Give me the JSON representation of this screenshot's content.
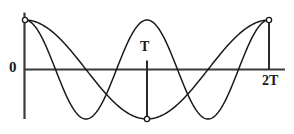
{
  "figure": {
    "title": "",
    "background_color": "#ffffff",
    "curve_color": "#1a1a1a",
    "axis_color": "#3a3a3a",
    "marker_fill": "#ffffff"
  },
  "labels": {
    "origin": "0",
    "period": "T",
    "double_period": "2T"
  },
  "chart_data": {
    "type": "line",
    "title": "",
    "xlabel": "",
    "ylabel": "",
    "xlim": [
      0,
      2
    ],
    "ylim": [
      -1,
      1
    ],
    "grid": false,
    "legend": "none",
    "x_tick_labels": [
      "0",
      "T",
      "2T"
    ],
    "x_tick_values": [
      0,
      1,
      2
    ],
    "x_unit": "T (period)",
    "y_tick_labels": [],
    "annotations": [
      {
        "text": "0",
        "x": 0,
        "y": 0,
        "placement": "left-of-axis"
      },
      {
        "text": "T",
        "x": 1,
        "y": 0,
        "placement": "above-axis"
      },
      {
        "text": "2T",
        "x": 2,
        "y": 0,
        "placement": "below-axis"
      }
    ],
    "markers": [
      {
        "x": 0,
        "y": 1,
        "style": "open-circle"
      },
      {
        "x": 1,
        "y": -1,
        "style": "open-circle"
      },
      {
        "x": 2,
        "y": 1,
        "style": "open-circle"
      }
    ],
    "vertical_guides": [
      {
        "x": 0,
        "y_from": -1,
        "y_to": 1.15,
        "name": "y-axis"
      },
      {
        "x": 1,
        "y_from": -1,
        "y_to": 0.18,
        "name": "t-marker-line"
      },
      {
        "x": 2,
        "y_from": 0,
        "y_to": 1,
        "name": "two-t-marker-line"
      }
    ],
    "series": [
      {
        "name": "fast-mode",
        "description": "cos(2*pi*x) - two full cycles over 0 to 2T",
        "period": 1,
        "amplitude": 1,
        "x": [
          0,
          0.0625,
          0.125,
          0.1875,
          0.25,
          0.3125,
          0.375,
          0.4375,
          0.5,
          0.5625,
          0.625,
          0.6875,
          0.75,
          0.8125,
          0.875,
          0.9375,
          1,
          1.0625,
          1.125,
          1.1875,
          1.25,
          1.3125,
          1.375,
          1.4375,
          1.5,
          1.5625,
          1.625,
          1.6875,
          1.75,
          1.8125,
          1.875,
          1.9375,
          2
        ],
        "y": [
          1,
          0.924,
          0.707,
          0.383,
          0,
          -0.383,
          -0.707,
          -0.924,
          -1,
          -0.924,
          -0.707,
          -0.383,
          0,
          0.383,
          0.707,
          0.924,
          1,
          0.924,
          0.707,
          0.383,
          0,
          -0.383,
          -0.707,
          -0.924,
          -1,
          -0.924,
          -0.707,
          -0.383,
          0,
          0.383,
          0.707,
          0.924,
          1
        ]
      },
      {
        "name": "slow-mode",
        "description": "cos(pi*x) - one full cycle over 0 to 2T",
        "period": 2,
        "amplitude": 1,
        "x": [
          0,
          0.125,
          0.25,
          0.375,
          0.5,
          0.625,
          0.75,
          0.875,
          1,
          1.125,
          1.25,
          1.375,
          1.5,
          1.625,
          1.75,
          1.875,
          2
        ],
        "y": [
          1,
          0.924,
          0.707,
          0.383,
          0,
          -0.383,
          -0.707,
          -0.924,
          -1,
          -0.924,
          -0.707,
          -0.383,
          0,
          0.383,
          0.707,
          0.924,
          1
        ]
      }
    ]
  }
}
